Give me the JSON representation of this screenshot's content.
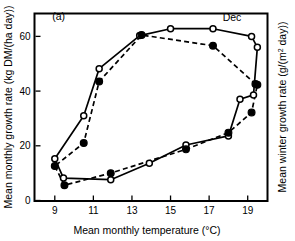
{
  "figure": {
    "panel_label": "(a)",
    "background": "#ffffff",
    "ink": "#000000"
  },
  "chart_data": {
    "type": "line",
    "title": "",
    "panel": "(a)",
    "xlabel": "Mean monthly temperature (°C)",
    "ylabel": "Mean monthly growth rate (kg DM/(ha day))",
    "ylabel_right": "Mean winter growth rate (g/(m² day))",
    "xlim": [
      8.0,
      20.0
    ],
    "ylim": [
      0,
      68
    ],
    "xticks": [
      9,
      11,
      13,
      15,
      17,
      19
    ],
    "xtick_labels": [
      "9",
      "11",
      "13",
      "15",
      "17",
      "19"
    ],
    "yticks": [
      0,
      20,
      40,
      60
    ],
    "ytick_labels": [
      "0",
      "20",
      "40",
      "60"
    ],
    "right_axis_ticks": [],
    "grid": false,
    "legend": false,
    "legend_position": "none",
    "annotations": [
      {
        "text": "Dec",
        "x": 17.7,
        "y": 65.5,
        "anchor": "start"
      },
      {
        "text": "(a)",
        "x": 9.2,
        "y": 66.0,
        "anchor": "middle"
      }
    ],
    "series": [
      {
        "name": "open-circle-hysteresis-loop",
        "marker": "open-circle",
        "linestyle": "solid",
        "closed_loop": true,
        "color": "#000000",
        "points": [
          {
            "x": 9.0,
            "y": 15.3
          },
          {
            "x": 9.45,
            "y": 8.2
          },
          {
            "x": 11.9,
            "y": 7.6
          },
          {
            "x": 13.9,
            "y": 13.6
          },
          {
            "x": 15.8,
            "y": 20.3
          },
          {
            "x": 18.0,
            "y": 23.6
          },
          {
            "x": 18.6,
            "y": 37.0
          },
          {
            "x": 19.3,
            "y": 38.6
          },
          {
            "x": 19.5,
            "y": 56.0
          },
          {
            "x": 19.2,
            "y": 60.0
          },
          {
            "x": 17.2,
            "y": 62.8
          },
          {
            "x": 15.0,
            "y": 62.8
          },
          {
            "x": 13.4,
            "y": 60.3
          },
          {
            "x": 11.3,
            "y": 48.2
          },
          {
            "x": 10.5,
            "y": 31.0
          }
        ]
      },
      {
        "name": "filled-circle-hysteresis-loop",
        "marker": "filled-circle",
        "linestyle": "dashed",
        "closed_loop": true,
        "color": "#000000",
        "points": [
          {
            "x": 9.0,
            "y": 12.6
          },
          {
            "x": 9.5,
            "y": 5.6
          },
          {
            "x": 11.9,
            "y": 10.0
          },
          {
            "x": 15.8,
            "y": 18.7
          },
          {
            "x": 18.0,
            "y": 24.8
          },
          {
            "x": 19.2,
            "y": 32.2
          },
          {
            "x": 19.5,
            "y": 42.3
          },
          {
            "x": 19.4,
            "y": 42.6
          },
          {
            "x": 17.2,
            "y": 56.6
          },
          {
            "x": 13.5,
            "y": 60.5
          },
          {
            "x": 11.3,
            "y": 43.5
          },
          {
            "x": 10.5,
            "y": 21.0
          }
        ]
      }
    ]
  }
}
